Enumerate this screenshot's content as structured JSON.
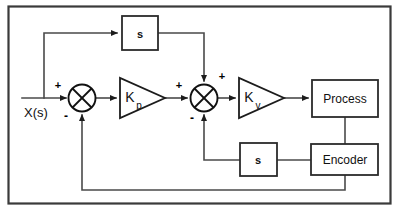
{
  "diagram": {
    "type": "control-system-block-diagram",
    "frame": {
      "name": "outer-border",
      "stroke": "#3a3a3a"
    },
    "colors": {
      "line": "#4a4a4a",
      "block_stroke": "#2b2b2b",
      "text": "#111111",
      "background": "#ffffff"
    },
    "input": {
      "label": "X(s)"
    },
    "blocks": [
      {
        "id": "s_top",
        "label": "s",
        "shape": "rect"
      },
      {
        "id": "s_bottom",
        "label": "s",
        "shape": "rect"
      },
      {
        "id": "process",
        "label": "Process",
        "shape": "rect"
      },
      {
        "id": "encoder",
        "label": "Encoder",
        "shape": "rect"
      }
    ],
    "gains": [
      {
        "id": "kp",
        "main": "K",
        "sub": "p",
        "shape": "triangle"
      },
      {
        "id": "kv",
        "main": "K",
        "sub": "v",
        "shape": "triangle"
      }
    ],
    "summing_junctions": [
      {
        "id": "sum1",
        "shape": "circle-cross",
        "signs": [
          {
            "position": "top-left",
            "label": "+"
          },
          {
            "position": "bottom",
            "label": "-"
          }
        ]
      },
      {
        "id": "sum2",
        "shape": "circle-cross",
        "signs": [
          {
            "position": "left",
            "label": "+"
          },
          {
            "position": "top-right",
            "label": "+"
          },
          {
            "position": "bottom",
            "label": "-"
          }
        ]
      }
    ],
    "signal_paths": [
      {
        "id": "input-to-sum1",
        "from": "X(s)",
        "to": "sum1"
      },
      {
        "id": "input-branch-to-s-top",
        "from": "X(s)",
        "to": "s_top"
      },
      {
        "id": "s-top-to-sum2",
        "from": "s_top",
        "to": "sum2"
      },
      {
        "id": "sum1-to-kp",
        "from": "sum1",
        "to": "kp"
      },
      {
        "id": "kp-to-sum2",
        "from": "kp",
        "to": "sum2"
      },
      {
        "id": "sum2-to-kv",
        "from": "sum2",
        "to": "kv"
      },
      {
        "id": "kv-to-process",
        "from": "kv",
        "to": "process"
      },
      {
        "id": "process-to-encoder",
        "from": "process",
        "to": "encoder"
      },
      {
        "id": "encoder-to-s-bottom",
        "from": "encoder",
        "to": "s_bottom"
      },
      {
        "id": "s-bottom-to-sum2",
        "from": "s_bottom",
        "to": "sum2"
      },
      {
        "id": "encoder-to-sum1",
        "from": "encoder",
        "to": "sum1"
      }
    ]
  }
}
